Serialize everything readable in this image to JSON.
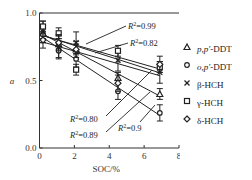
{
  "chart_data": {
    "type": "scatter",
    "title": "",
    "xlabel": "SOC/%",
    "ylabel": "a",
    "xlim": [
      0,
      8
    ],
    "ylim": [
      0.0,
      1.0
    ],
    "x_ticks": [
      "0",
      "2",
      "4",
      "6",
      "8"
    ],
    "y_ticks": [
      "0.0",
      "0.5",
      "1.0"
    ],
    "x": [
      0.2,
      1.1,
      2.1,
      4.5,
      6.9
    ],
    "series": [
      {
        "name": "p,p'-DDT",
        "marker": "triangle",
        "values": [
          0.85,
          0.77,
          0.73,
          0.52,
          0.4
        ],
        "fit_r2": "R²=0.9"
      },
      {
        "name": "o,p'-DDT",
        "marker": "circle",
        "values": [
          0.84,
          0.72,
          0.66,
          0.42,
          0.26
        ],
        "fit_r2": "R²=0.89"
      },
      {
        "name": "β-HCH",
        "marker": "x",
        "values": [
          0.86,
          0.75,
          0.78,
          0.65,
          0.56
        ],
        "fit_r2": "R²=0.82"
      },
      {
        "name": "γ-HCH",
        "marker": "square",
        "values": [
          0.9,
          0.85,
          0.58,
          0.72,
          0.6
        ],
        "fit_r2": "R²=0.99"
      },
      {
        "name": "δ-HCH",
        "marker": "diamond",
        "values": [
          0.8,
          0.78,
          0.73,
          0.48,
          0.62
        ],
        "fit_r2": "R²=0.80"
      }
    ],
    "annotations": [
      "R²=0.99",
      "R²=0.82",
      "R²=0.80",
      "R²=0.89",
      "R²=0.9"
    ],
    "grid": false,
    "legend_position": "right"
  },
  "legend": [
    {
      "label_italic": "p,p'",
      "label_rest": "-DDT",
      "marker": "triangle"
    },
    {
      "label_italic": "o,p'",
      "label_rest": "-DDT",
      "marker": "circle"
    },
    {
      "label_italic": "",
      "label_rest": "β-HCH",
      "marker": "x"
    },
    {
      "label_italic": "",
      "label_rest": "γ-HCH",
      "marker": "square"
    },
    {
      "label_italic": "",
      "label_rest": "δ-HCH",
      "marker": "diamond"
    }
  ]
}
